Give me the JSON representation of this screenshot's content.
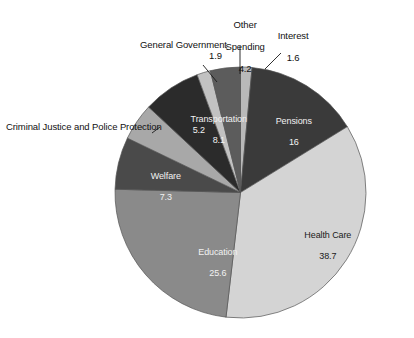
{
  "chart_data": {
    "type": "pie",
    "title": "",
    "subtitle": "",
    "xlabel": "",
    "ylabel": "",
    "legend_position": "none",
    "grid": false,
    "units": "percent",
    "total": 108.6,
    "start_angle_deg": 0,
    "direction": "clockwise",
    "categories": [
      "Pensions",
      "Health Care",
      "Education",
      "Welfare",
      "Criminal Justice and Police Protection",
      "Transportation",
      "General Government",
      "Other Spending",
      "Interest"
    ],
    "values": [
      16,
      38.7,
      25.6,
      7.3,
      5.2,
      8.1,
      1.9,
      4.2,
      1.6
    ],
    "slices": [
      {
        "id": "interest",
        "label": "Interest",
        "value": "1.6",
        "value_num": 1.6,
        "color": "#b9b9b9",
        "label_placement": "outside",
        "text_color": "#111111"
      },
      {
        "id": "pensions",
        "label": "Pensions",
        "value": "16",
        "value_num": 16,
        "color": "#3a3a3a",
        "label_placement": "inside",
        "text_color": "#f2f2f2"
      },
      {
        "id": "health-care",
        "label": "Health Care",
        "value": "38.7",
        "value_num": 38.7,
        "color": "#d4d4d4",
        "label_placement": "inside",
        "text_color": "#1a1a1a"
      },
      {
        "id": "education",
        "label": "Education",
        "value": "25.6",
        "value_num": 25.6,
        "color": "#8a8a8a",
        "label_placement": "inside",
        "text_color": "#f2f2f2"
      },
      {
        "id": "welfare",
        "label": "Welfare",
        "value": "7.3",
        "value_num": 7.3,
        "color": "#4a4a4a",
        "label_placement": "inside",
        "text_color": "#f2f2f2"
      },
      {
        "id": "criminal-justice",
        "label": "Criminal Justice and Police Protection",
        "value": "5.2",
        "value_num": 5.2,
        "color": "#a8a8a8",
        "label_placement": "outside",
        "text_color": "#111111"
      },
      {
        "id": "transportation",
        "label": "Transportation",
        "value": "8.1",
        "value_num": 8.1,
        "color": "#2b2b2b",
        "label_placement": "inside",
        "text_color": "#f2f2f2"
      },
      {
        "id": "general-government",
        "label": "General Government",
        "value": "1.9",
        "value_num": 1.9,
        "color": "#c2c2c2",
        "label_placement": "outside",
        "text_color": "#111111"
      },
      {
        "id": "other-spending",
        "label": "Other Spending",
        "value": "4.2",
        "value_num": 4.2,
        "color": "#5c5c5c",
        "label_placement": "outside",
        "text_color": "#111111"
      }
    ],
    "colors": {
      "background": "#ffffff",
      "outline": "#555555",
      "leader_line": "#1a1a1a",
      "label_dark": "#111111",
      "label_light": "#f2f2f2"
    }
  },
  "labels": {
    "interest": {
      "name": "Interest",
      "value": "1.6"
    },
    "pensions": {
      "name": "Pensions",
      "value": "16"
    },
    "health_care": {
      "name": "Health Care",
      "value": "38.7"
    },
    "education": {
      "name": "Education",
      "value": "25.6"
    },
    "welfare": {
      "name": "Welfare",
      "value": "7.3"
    },
    "criminal_justice": {
      "name": "Criminal Justice and Police Protection",
      "value": "5.2"
    },
    "transportation": {
      "name": "Transportation",
      "value": "8.1"
    },
    "general_government": {
      "name": "General Government",
      "value": "1.9"
    },
    "other_spending_line1": "Other",
    "other_spending_line2": "Spending",
    "other_spending_value": "4.2"
  }
}
